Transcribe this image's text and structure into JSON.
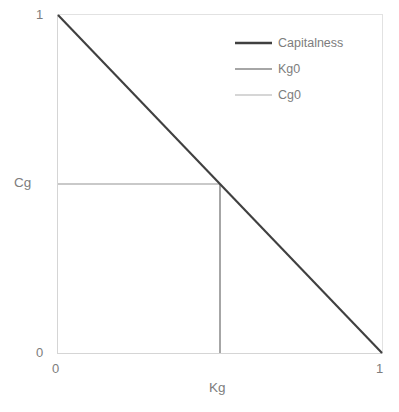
{
  "chart_data": {
    "type": "line",
    "title": "",
    "xlabel": "Kg",
    "ylabel": "Cg",
    "xlim": [
      0,
      1
    ],
    "ylim": [
      0,
      1
    ],
    "grid": false,
    "legend_position": "top-right",
    "x_ticks": [
      "0",
      "1"
    ],
    "y_ticks": [
      "0",
      "1"
    ],
    "series": [
      {
        "name": "Capitalness",
        "color": "#404040",
        "width": 2.1,
        "points": [
          [
            0,
            1
          ],
          [
            1,
            0
          ]
        ]
      },
      {
        "name": "Kg0",
        "color": "#a6a6a6",
        "width": 1.7,
        "points": [
          [
            0.5,
            0.5
          ],
          [
            0.5,
            0
          ]
        ]
      },
      {
        "name": "Cg0",
        "color": "#c9c9c9",
        "width": 1.4,
        "points": [
          [
            0,
            0.5
          ],
          [
            0.5,
            0.5
          ]
        ]
      }
    ],
    "annotations": {
      "cg0_level": 0.5,
      "kg0_level": 0.5,
      "intersection": [
        0.5,
        0.5
      ]
    }
  },
  "axes": {
    "y_tick_max": "1",
    "y_tick_min": "0",
    "x_tick_min": "0",
    "x_tick_max": "1",
    "y_title": "Cg",
    "x_title": "Kg"
  },
  "legend": {
    "items": [
      {
        "label": "Capitalness"
      },
      {
        "label": "Kg0"
      },
      {
        "label": "Cg0"
      }
    ]
  }
}
